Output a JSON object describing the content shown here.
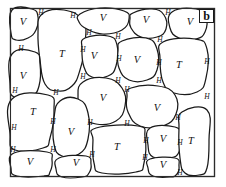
{
  "figure": {
    "panel_label": "b",
    "frame": {
      "x": 10,
      "y": 8,
      "width": 205,
      "height": 169
    },
    "colors": {
      "background": "#ffffff",
      "grain_outline": "#1a1a1a",
      "frame_outer": "#6e6e6e",
      "frame_inner": "#2b2b2b",
      "label_text": "#111111"
    }
  },
  "legend_symbols": {
    "grain_type_v": "V",
    "grain_type_t": "T",
    "boundary_marker": "H"
  },
  "grains": [
    {
      "id": "g1",
      "label": "V",
      "lx": 23,
      "ly": 23,
      "points": "12,10 32,9 38,17 36,30 28,38 16,40 11,33"
    },
    {
      "id": "g2",
      "label": "T",
      "lx": 62,
      "ly": 55,
      "points": "42,14 64,10 83,21 85,44 80,70 72,86 58,91 45,84 40,60 38,33"
    },
    {
      "id": "g3",
      "label": "V",
      "lx": 103,
      "ly": 19,
      "points": "80,14 100,8 124,11 129,19 122,30 103,34 87,29 79,22"
    },
    {
      "id": "g4",
      "label": "V",
      "lx": 146,
      "ly": 21,
      "points": "133,13 152,9 164,15 166,29 157,37 141,37 131,28 130,19"
    },
    {
      "id": "g5",
      "label": "V",
      "lx": 190,
      "ly": 23,
      "points": "172,12 196,9 206,17 205,32 196,39 179,38 170,28"
    },
    {
      "id": "g6",
      "label": "V",
      "lx": 94,
      "ly": 57,
      "points": "85,38 108,36 117,45 116,66 108,76 92,77 84,67 82,49"
    },
    {
      "id": "g7",
      "label": "V",
      "lx": 137,
      "ly": 61,
      "points": "122,41 146,38 157,49 157,70 147,80 129,80 119,68 118,51"
    },
    {
      "id": "g8",
      "label": "T",
      "lx": 179,
      "ly": 66,
      "points": "163,42 195,39 207,49 206,78 197,92 174,93 163,82 160,58"
    },
    {
      "id": "g9",
      "label": "V",
      "lx": 23,
      "ly": 77,
      "points": "12,54 35,52 40,64 39,86 31,96 14,97 10,84"
    },
    {
      "id": "g10",
      "label": "V",
      "lx": 103,
      "ly": 99,
      "points": "83,82 106,78 122,88 125,106 116,121 96,124 82,115 78,97"
    },
    {
      "id": "g11",
      "label": "V",
      "lx": 157,
      "ly": 109,
      "points": "131,88 158,86 175,95 176,114 163,126 140,126 128,112 127,97"
    },
    {
      "id": "g12",
      "label": "T",
      "lx": 33,
      "ly": 113,
      "points": "12,99 48,95 54,110 50,138 43,148 15,150 10,134"
    },
    {
      "id": "g13",
      "label": "V",
      "lx": 71,
      "ly": 133,
      "points": "60,101 78,99 88,113 88,139 79,154 62,156 54,144 54,118"
    },
    {
      "id": "g14",
      "label": "T",
      "lx": 117,
      "ly": 148,
      "points": "96,128 138,126 145,137 144,163 136,172 102,173 94,163 93,140"
    },
    {
      "id": "g15",
      "label": "V",
      "lx": 163,
      "ly": 140,
      "points": "150,128 175,127 180,136 179,152 170,158 153,157 148,145"
    },
    {
      "id": "g16",
      "label": "T",
      "lx": 191,
      "ly": 142,
      "points": "182,112 207,110 209,140 207,168 199,175 185,173 180,158 179,128"
    },
    {
      "id": "g17",
      "label": "V",
      "lx": 30,
      "ly": 163,
      "points": "14,153 47,152 52,160 50,172 44,176 17,176 11,168"
    },
    {
      "id": "g18",
      "label": "V",
      "lx": 76,
      "ly": 164,
      "points": "59,158 86,156 91,164 89,173 82,177 62,177 56,169"
    },
    {
      "id": "g19",
      "label": "V",
      "lx": 163,
      "ly": 166,
      "points": "150,159 175,158 179,166 177,174 170,177 153,176 148,168"
    }
  ],
  "boundary_markers": [
    {
      "id": "h1",
      "label": "H",
      "x": 41,
      "y": 13
    },
    {
      "id": "h2",
      "label": "H",
      "x": 73,
      "y": 16
    },
    {
      "id": "h3",
      "label": "H",
      "x": 168,
      "y": 13
    },
    {
      "id": "h4",
      "label": "H",
      "x": 21,
      "y": 49
    },
    {
      "id": "h5",
      "label": "H",
      "x": 89,
      "y": 33
    },
    {
      "id": "h6",
      "label": "H",
      "x": 118,
      "y": 37
    },
    {
      "id": "h7",
      "label": "H",
      "x": 160,
      "y": 40
    },
    {
      "id": "h8",
      "label": "H",
      "x": 83,
      "y": 50
    },
    {
      "id": "h9",
      "label": "H",
      "x": 119,
      "y": 59
    },
    {
      "id": "h10",
      "label": "H",
      "x": 159,
      "y": 63
    },
    {
      "id": "h11",
      "label": "H",
      "x": 207,
      "y": 62
    },
    {
      "id": "h12",
      "label": "H",
      "x": 83,
      "y": 77
    },
    {
      "id": "h13",
      "label": "H",
      "x": 118,
      "y": 81
    },
    {
      "id": "h14",
      "label": "H",
      "x": 159,
      "y": 81
    },
    {
      "id": "h15",
      "label": "H",
      "x": 15,
      "y": 91
    },
    {
      "id": "h16",
      "label": "H",
      "x": 56,
      "y": 93
    },
    {
      "id": "h17",
      "label": "H",
      "x": 127,
      "y": 90
    },
    {
      "id": "h18",
      "label": "H",
      "x": 207,
      "y": 97
    },
    {
      "id": "h19",
      "label": "H",
      "x": 53,
      "y": 122
    },
    {
      "id": "h20",
      "label": "H",
      "x": 90,
      "y": 123
    },
    {
      "id": "h21",
      "label": "H",
      "x": 14,
      "y": 128
    },
    {
      "id": "h22",
      "label": "H",
      "x": 127,
      "y": 124
    },
    {
      "id": "h23",
      "label": "H",
      "x": 178,
      "y": 118
    },
    {
      "id": "h24",
      "label": "H",
      "x": 146,
      "y": 141
    },
    {
      "id": "h25",
      "label": "H",
      "x": 180,
      "y": 143
    },
    {
      "id": "h26",
      "label": "H",
      "x": 13,
      "y": 150
    },
    {
      "id": "h27",
      "label": "H",
      "x": 53,
      "y": 150
    },
    {
      "id": "h28",
      "label": "H",
      "x": 92,
      "y": 155
    },
    {
      "id": "h29",
      "label": "H",
      "x": 145,
      "y": 158
    },
    {
      "id": "h30",
      "label": "H",
      "x": 180,
      "y": 173
    }
  ],
  "panel_tag": {
    "text": "b",
    "x": 199,
    "y": 9,
    "width": 15,
    "height": 14
  }
}
